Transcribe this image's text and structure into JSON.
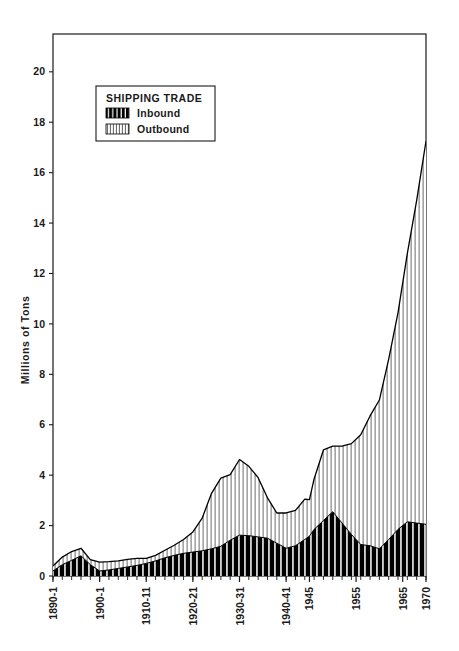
{
  "chart_data": {
    "type": "area",
    "title": "",
    "subtitle": "",
    "xlabel": "",
    "ylabel": "Millions of Tons",
    "ylim": [
      0,
      21.5
    ],
    "xlim": [
      1890,
      1970
    ],
    "grid": false,
    "stacked": true,
    "legend": {
      "title": "SHIPPING TRADE",
      "position": "top-left-inside",
      "entries": [
        {
          "name": "Inbound",
          "pattern": "black-with-white-vertical-stripes"
        },
        {
          "name": "Outbound",
          "pattern": "white-with-dark-vertical-stripes"
        }
      ]
    },
    "yticks": [
      0,
      2,
      4,
      6,
      8,
      10,
      12,
      14,
      16,
      18,
      20
    ],
    "ytick_labels": [
      "0",
      "2",
      "4",
      "6",
      "8",
      "10",
      "12",
      "14",
      "16",
      "18",
      "20"
    ],
    "xticks": [
      1890,
      1900,
      1910,
      1920,
      1930,
      1940,
      1945,
      1955,
      1965,
      1970
    ],
    "xtick_labels": [
      "1890-1",
      "1900-1",
      "1910-11",
      "1920-21",
      "1930-31",
      "1940-41",
      "1945",
      "1955",
      "1965",
      "1970"
    ],
    "x": [
      1890,
      1892,
      1894,
      1896,
      1898,
      1900,
      1902,
      1904,
      1906,
      1908,
      1910,
      1912,
      1914,
      1916,
      1918,
      1920,
      1922,
      1924,
      1926,
      1928,
      1930,
      1932,
      1934,
      1936,
      1938,
      1940,
      1942,
      1944,
      1945,
      1946,
      1948,
      1950,
      1952,
      1954,
      1956,
      1958,
      1960,
      1962,
      1964,
      1966,
      1968,
      1970
    ],
    "series": [
      {
        "name": "Inbound",
        "values": [
          0.2,
          0.45,
          0.62,
          0.8,
          0.45,
          0.2,
          0.24,
          0.3,
          0.36,
          0.42,
          0.5,
          0.6,
          0.72,
          0.82,
          0.9,
          0.95,
          1.0,
          1.08,
          1.18,
          1.42,
          1.62,
          1.6,
          1.55,
          1.5,
          1.3,
          1.1,
          1.2,
          1.45,
          1.58,
          1.85,
          2.2,
          2.55,
          2.1,
          1.65,
          1.25,
          1.2,
          1.08,
          1.45,
          1.85,
          2.15,
          2.1,
          2.05
        ]
      },
      {
        "name": "Outbound",
        "values": [
          0.2,
          0.3,
          0.35,
          0.3,
          0.2,
          0.35,
          0.33,
          0.3,
          0.3,
          0.28,
          0.2,
          0.22,
          0.3,
          0.4,
          0.55,
          0.8,
          1.3,
          2.2,
          2.7,
          2.6,
          3.0,
          2.75,
          2.35,
          1.6,
          1.2,
          1.4,
          1.4,
          1.6,
          1.45,
          2.0,
          2.8,
          2.6,
          3.05,
          3.6,
          4.35,
          5.15,
          5.9,
          7.15,
          8.6,
          10.65,
          12.8,
          15.2
        ]
      }
    ],
    "totals": [
      0.4,
      0.75,
      0.97,
      1.1,
      0.65,
      0.55,
      0.57,
      0.6,
      0.66,
      0.7,
      0.7,
      0.82,
      1.02,
      1.22,
      1.45,
      1.75,
      2.3,
      3.28,
      3.88,
      4.02,
      4.62,
      4.35,
      3.9,
      3.1,
      2.5,
      2.5,
      2.6,
      3.05,
      3.03,
      3.85,
      5.0,
      5.15,
      5.15,
      5.25,
      5.6,
      6.35,
      6.98,
      8.6,
      10.45,
      12.8,
      14.9,
      17.25
    ]
  },
  "colors": {
    "axis": "#1a1a1a",
    "inbound_fill": "#000000",
    "inbound_stripe": "#ffffff",
    "outbound_fill": "#ffffff",
    "outbound_stripe": "#5a5a5a",
    "outline": "#000000",
    "background": "#ffffff"
  }
}
